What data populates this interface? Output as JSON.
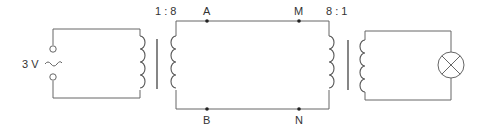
{
  "diagram": {
    "source": {
      "voltage_label": "3 V",
      "symbol": "ac-source"
    },
    "transformer_1": {
      "ratio_label": "1 : 8",
      "type": "step-up"
    },
    "transformer_2": {
      "ratio_label": "8 : 1",
      "type": "step-down"
    },
    "nodes": {
      "A": "A",
      "B": "B",
      "M": "M",
      "N": "N"
    },
    "load": {
      "symbol": "lamp"
    }
  }
}
